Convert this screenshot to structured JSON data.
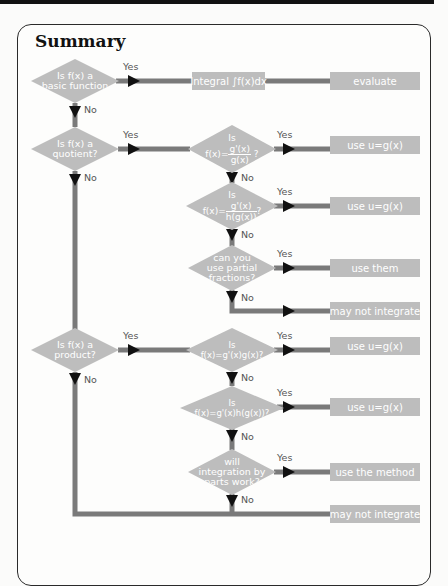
{
  "title": "Summary",
  "colors": {
    "node_fill": "#bdbdbd",
    "connector": "#7a7a7a",
    "arrowhead": "#111111",
    "node_text": "#ffffff",
    "label_text": "#555555"
  },
  "edge_labels": {
    "yes": "Yes",
    "no": "No"
  },
  "nodes": {
    "d1": {
      "line1": "Is f(x) a",
      "line2": "basic function"
    },
    "d2": {
      "line1": "Is f(x) a",
      "line2": "quotient?"
    },
    "d3": {
      "pre": "Is",
      "lhs": "f(x)=",
      "num": "g'(x)",
      "den": "g(x)",
      "post": "?"
    },
    "d4": {
      "pre": "Is",
      "lhs": "f(x)=",
      "num": "g'(x)",
      "den": "h(g(x))",
      "post": "?"
    },
    "d5": {
      "line1": "can you",
      "line2": "use partial",
      "line3": "fractions?"
    },
    "d7": {
      "line1": "Is f(x) a",
      "line2": "product?"
    },
    "d8": {
      "pre": "Is",
      "expr": "f(x)=g'(x)g(x)?"
    },
    "d9": {
      "pre": "Is",
      "expr": "f(x)=g'(x)h(g(x))?"
    },
    "d10": {
      "line1": "will",
      "line2": "integration by",
      "line3": "parts work?"
    }
  },
  "boxes": {
    "integral": "Integral ∫f(x)dx",
    "evaluate": "evaluate",
    "sub1": "use  u=g(x)",
    "sub2": "use  u=g(x)",
    "use_them": "use them",
    "may_not_1": "may not integrate",
    "sub3": "use  u=g(x)",
    "sub4": "use  u=g(x)",
    "use_method": "use the method",
    "may_not_2": "may not integrate"
  }
}
